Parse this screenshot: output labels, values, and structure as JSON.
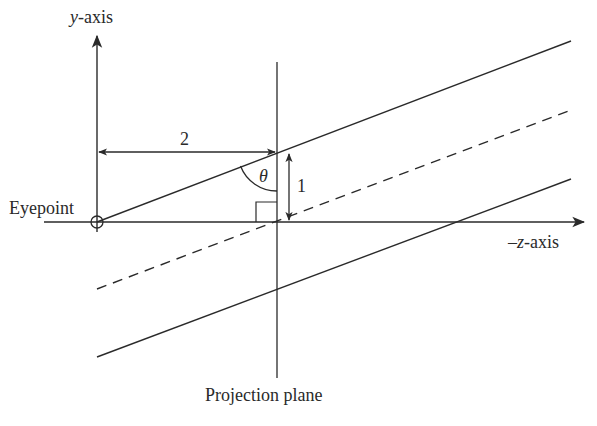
{
  "diagram": {
    "labels": {
      "y_axis_var": "y",
      "y_axis_suffix": "-axis",
      "z_axis_prefix": "–",
      "z_axis_var": "z",
      "z_axis_suffix": "-axis",
      "eyepoint": "Eyepoint",
      "projection_plane": "Projection plane",
      "distance_to_plane": "2",
      "half_height": "1",
      "angle": "θ"
    },
    "colors": {
      "stroke": "#2a2a2a",
      "background": "#ffffff"
    },
    "geometry": {
      "eyepoint": [
        97,
        222
      ],
      "plane_x": 277,
      "plane_top": 62,
      "plane_bottom": 378,
      "y_axis_top": 34,
      "z_axis_left": 44,
      "z_axis_right": 585,
      "upper_ray": {
        "from": [
          97,
          222
        ],
        "to": [
          571,
          41
        ]
      },
      "center_ray_dashed": {
        "from": [
          97,
          289
        ],
        "to": [
          571,
          110
        ]
      },
      "lower_ray": {
        "from": [
          97,
          357
        ],
        "to": [
          571,
          179
        ]
      },
      "dimension_2_y": 152,
      "dimension_1_x": 289
    }
  }
}
